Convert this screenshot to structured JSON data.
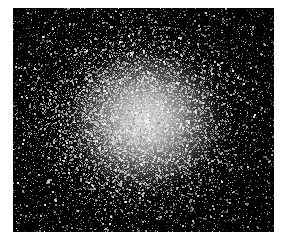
{
  "image": {
    "subject": "globular star cluster",
    "palette": {
      "background": "#000000",
      "core": "#ffffff",
      "page": "#ffffff"
    },
    "frame": {
      "x": 13,
      "y": 8,
      "width": 261,
      "height": 224
    },
    "core_center": {
      "x": 135,
      "y": 120
    }
  }
}
